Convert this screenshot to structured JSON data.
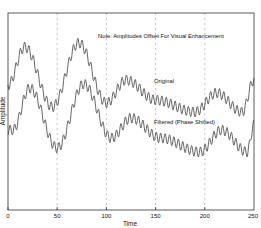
{
  "chart_data": {
    "type": "line",
    "title": "",
    "xlabel": "Time",
    "ylabel": "Amplitude",
    "xlim": [
      0,
      250
    ],
    "xticks": [
      0,
      50,
      100,
      150,
      200,
      250
    ],
    "xtick_labels": [
      "0",
      "50",
      "100",
      "150",
      "200",
      "250"
    ],
    "yticks": [],
    "grid": {
      "x": true,
      "y": false,
      "style": "dashed"
    },
    "annotations": [
      {
        "text": "Note:  Amplitudes Offset For Visual Enhancement",
        "x": 98,
        "y": "top"
      },
      {
        "text": "Original",
        "x": 155,
        "near_series": "Original"
      },
      {
        "text": "Filtered (Phase Shifted)",
        "x": 155,
        "near_series": "Filtered (Phase Shifted)"
      }
    ],
    "series": [
      {
        "name": "Original",
        "description": "Low-frequency wave with superimposed high-frequency ripple (period ~4.5 time units)",
        "envelope_x": [
          0,
          17,
          45,
          72,
          100,
          120,
          150,
          190,
          212,
          238,
          250
        ],
        "envelope_y_px": [
          85,
          47,
          107,
          43,
          103,
          80,
          100,
          112,
          93,
          112,
          80
        ],
        "ripple_period": 4.5,
        "ripple_amplitude_px": 5
      },
      {
        "name": "Filtered (Phase Shifted)",
        "description": "Same signal offset downward and delayed in phase",
        "envelope_x": [
          0,
          5,
          22,
          50,
          77,
          105,
          125,
          155,
          195,
          217,
          243,
          250
        ],
        "envelope_y_px": [
          130,
          130,
          88,
          148,
          84,
          138,
          118,
          138,
          152,
          130,
          152,
          125
        ],
        "ripple_period": 4.5,
        "ripple_amplitude_px": 5
      }
    ]
  },
  "labels": {
    "note": "Note:  Amplitudes Offset For Visual Enhancement",
    "original": "Original",
    "filtered": "Filtered (Phase Shifted)",
    "xlabel": "Time",
    "ylabel": "Amplitude",
    "ticks": [
      "0",
      "50",
      "100",
      "150",
      "200",
      "250"
    ]
  },
  "colors": {
    "line": "#555555",
    "frame": "#333333",
    "grid": "#9a9a9a"
  }
}
